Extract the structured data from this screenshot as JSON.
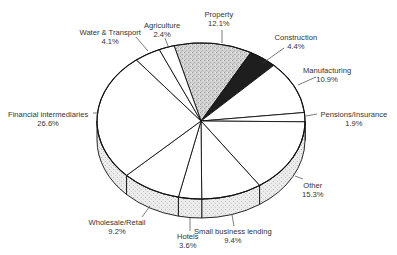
{
  "chart_data": {
    "type": "pie",
    "style": "3d-exploded-none",
    "title": "",
    "start_angle_deg": -105,
    "direction": "clockwise",
    "slices": [
      {
        "label": "Property",
        "value": 12.1,
        "display": "12.1%",
        "fill": "#c8c8c8",
        "pattern": "stipple"
      },
      {
        "label": "Construction",
        "value": 4.4,
        "display": "4.4%",
        "fill": "#1e1e1e",
        "pattern": "solid"
      },
      {
        "label": "Manufacturing",
        "value": 10.9,
        "display": "10.9%",
        "fill": "#ffffff",
        "pattern": "none"
      },
      {
        "label": "Pensions/Insurance",
        "value": 1.9,
        "display": "1.9%",
        "fill": "#ffffff",
        "pattern": "none"
      },
      {
        "label": "Other",
        "value": 15.3,
        "display": "15.3%",
        "fill": "#ffffff",
        "pattern": "none"
      },
      {
        "label": "Small business lending",
        "value": 9.4,
        "display": "9.4%",
        "fill": "#ffffff",
        "pattern": "none"
      },
      {
        "label": "Hotels",
        "value": 3.6,
        "display": "3.6%",
        "fill": "#ffffff",
        "pattern": "none"
      },
      {
        "label": "Wholesale/Retail",
        "value": 9.2,
        "display": "9.2%",
        "fill": "#ffffff",
        "pattern": "none"
      },
      {
        "label": "Financial intermediaries",
        "value": 26.6,
        "display": "26.6%",
        "fill": "#ffffff",
        "pattern": "none"
      },
      {
        "label": "Water & Transport",
        "value": 4.1,
        "display": "4.1%",
        "fill": "#ffffff",
        "pattern": "none"
      },
      {
        "label": "Agriculture",
        "value": 2.4,
        "display": "2.4%",
        "fill": "#ffffff",
        "pattern": "none"
      }
    ],
    "side_fill": "#e4e4e4",
    "legend": "none",
    "labels_position": "outside-with-leader-lines"
  },
  "labels": [
    {
      "name": "Property",
      "pct": "12.1%",
      "x": 219,
      "y": 10,
      "lx1": 222,
      "ly1": 30,
      "lx2": 222,
      "ly2": 43
    },
    {
      "name": "Construction",
      "pct": "4.4%",
      "x": 296,
      "y": 33,
      "lx1": 284,
      "ly1": 48,
      "lx2": 263,
      "ly2": 63
    },
    {
      "name": "Manufacturing",
      "pct": "10.9%",
      "x": 327,
      "y": 66,
      "lx1": 316,
      "ly1": 77,
      "lx2": 298,
      "ly2": 85
    },
    {
      "name": "Pensions/Insurance",
      "pct": "1.9%",
      "x": 354,
      "y": 110,
      "lx1": 317,
      "ly1": 114,
      "lx2": 306,
      "ly2": 116
    },
    {
      "name": "Other",
      "pct": "15.3%",
      "x": 313,
      "y": 181,
      "lx1": 303,
      "ly1": 179,
      "lx2": 295,
      "ly2": 176
    },
    {
      "name": "Small business lending",
      "pct": "9.4%",
      "x": 233,
      "y": 227,
      "lx1": 234,
      "ly1": 226,
      "lx2": 232,
      "ly2": 215
    },
    {
      "name": "Hotels",
      "pct": "3.6%",
      "x": 188,
      "y": 232,
      "lx1": 190,
      "ly1": 231,
      "lx2": 190,
      "ly2": 218
    },
    {
      "name": "Wholesale/Retail",
      "pct": "9.2%",
      "x": 117,
      "y": 218,
      "lx1": 142,
      "ly1": 217,
      "lx2": 150,
      "ly2": 206
    },
    {
      "name": "Financial intermediaries",
      "pct": "26.6%",
      "x": 48,
      "y": 110,
      "lx1": 93,
      "ly1": 113,
      "lx2": 99,
      "ly2": 113
    },
    {
      "name": "Water & Transport",
      "pct": "4.1%",
      "x": 110,
      "y": 28,
      "lx1": 136,
      "ly1": 37,
      "lx2": 148,
      "ly2": 51
    },
    {
      "name": "Agriculture",
      "pct": "2.4%",
      "x": 162,
      "y": 21,
      "lx1": 165,
      "ly1": 38,
      "lx2": 168,
      "ly2": 46
    }
  ],
  "geometry": {
    "cx": 201,
    "cy": 121,
    "rx": 104,
    "ry": 78,
    "depth": 19
  }
}
